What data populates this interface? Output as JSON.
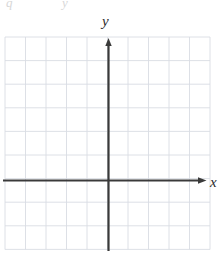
{
  "figure": {
    "kind": "coordinate-plane",
    "background_color": "#ffffff",
    "grid": {
      "line_color": "#d9dde3",
      "line_width": 0.9,
      "border_color": "#d0d5db",
      "columns": 10,
      "rows": 9,
      "cell_size_px": 20.5,
      "left_px": 5,
      "top_px": 37,
      "right_px": 210,
      "bottom_px": 249.5
    },
    "axes": {
      "color": "#3a3a3a",
      "line_width": 2.2,
      "origin_x_px": 108.5,
      "origin_y_px": 180.5,
      "x_axis": {
        "label": "x",
        "start_px": 3,
        "end_px": 203,
        "arrow": "right",
        "arrow_tip_px": 205
      },
      "y_axis": {
        "label": "y",
        "start_px": 250,
        "end_px": 44,
        "arrow": "up",
        "arrow_tip_px": 37
      },
      "tick_labels": [],
      "origin_label": ""
    },
    "ghost_text": {
      "left": "q",
      "right": "y"
    }
  }
}
